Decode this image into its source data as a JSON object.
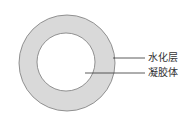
{
  "diagram": {
    "title": "",
    "colors": {
      "ring_fill": "#d9d9d9",
      "inner_fill": "#ffffff",
      "stroke": "#7a7a7a",
      "leader_line": "#333333"
    },
    "labels": [
      {
        "text": "水化层",
        "target": "outer ring"
      },
      {
        "text": "凝胶体",
        "target": "inner core"
      }
    ]
  }
}
